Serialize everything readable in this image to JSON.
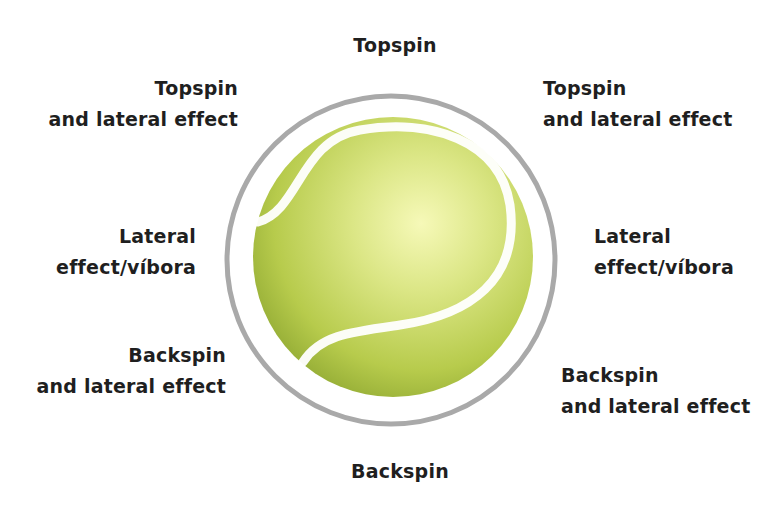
{
  "diagram": {
    "labels": {
      "top": [
        "Topspin"
      ],
      "top_left": [
        "Topspin",
        "and lateral effect"
      ],
      "top_right": [
        "Topspin",
        "and lateral effect"
      ],
      "left": [
        "Lateral",
        "effect/víbora"
      ],
      "right": [
        "Lateral",
        "effect/víbora"
      ],
      "bottom_left": [
        "Backspin",
        "and lateral effect"
      ],
      "bottom_right": [
        "Backspin",
        "and lateral effect"
      ],
      "bottom": [
        "Backspin"
      ]
    },
    "colors": {
      "ring": "#a9a9a9",
      "ball_light": "#f4f7b0",
      "ball_mid": "#c6d65a",
      "ball_dark": "#8fa832",
      "seam": "#ffffff",
      "text": "#1f1f1f"
    }
  }
}
